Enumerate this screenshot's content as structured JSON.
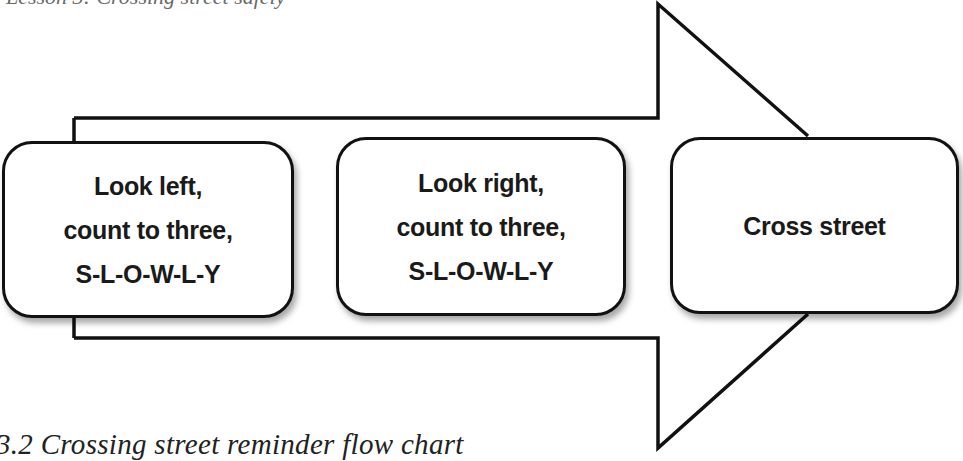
{
  "figure": {
    "top_clipped_text": "Lesson 3: Crossing street safely",
    "caption": "3.2 Crossing street reminder flow chart",
    "arrow": {
      "direction": "right",
      "stroke_color": "#111111",
      "fill_color": "#ffffff"
    },
    "steps": [
      {
        "lines": [
          "Look left,",
          "count to three,",
          "S-L-O-W-L-Y"
        ]
      },
      {
        "lines": [
          "Look right,",
          "count to three,",
          "S-L-O-W-L-Y"
        ]
      },
      {
        "lines": [
          "Cross street"
        ]
      }
    ]
  }
}
